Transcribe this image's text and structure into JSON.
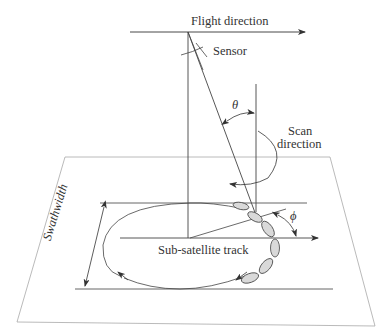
{
  "diagram": {
    "labels": {
      "flight_direction": "Flight direction",
      "sensor": "Sensor",
      "theta": "θ",
      "scan_direction_line1": "Scan",
      "scan_direction_line2": "direction",
      "phi": "ϕ",
      "swathwidth": "Swathwidth",
      "sub_satellite_track": "Sub-satellite track"
    },
    "colors": {
      "line": "#333333",
      "plane_edge": "#9a9a9a",
      "footprint_fill": "#d9d9d9"
    }
  }
}
